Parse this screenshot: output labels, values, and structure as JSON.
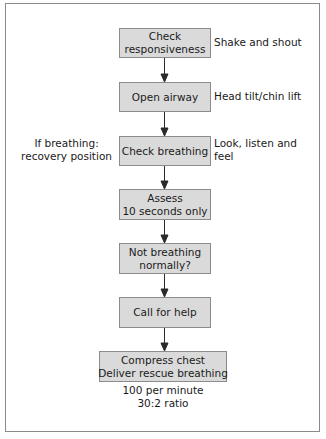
{
  "diagram": {
    "type": "flowchart",
    "title": "",
    "colors": {
      "box_fill": "#dadada",
      "box_border": "#8c8c8c",
      "arrow": "#2a2a2a",
      "frame": "#8a8a8a"
    },
    "steps": [
      {
        "id": "check-responsiveness",
        "lines": [
          "Check",
          "responsiveness"
        ],
        "note_right": [
          "Shake and shout"
        ]
      },
      {
        "id": "open-airway",
        "lines": [
          "Open airway"
        ],
        "note_right": [
          "Head tilt/chin lift"
        ]
      },
      {
        "id": "check-breathing",
        "lines": [
          "Check breathing"
        ],
        "note_right": [
          "Look, listen and",
          "feel"
        ],
        "note_left": [
          "If breathing:",
          "recovery position"
        ]
      },
      {
        "id": "assess",
        "lines": [
          "Assess",
          "10 seconds only"
        ]
      },
      {
        "id": "not-breathing",
        "lines": [
          "Not breathing",
          "normally?"
        ]
      },
      {
        "id": "call-for-help",
        "lines": [
          "Call for help"
        ]
      },
      {
        "id": "compress-chest",
        "lines": [
          "Compress chest",
          "Deliver rescue breathing"
        ],
        "note_below": [
          "100 per minute",
          "30:2 ratio"
        ]
      }
    ],
    "edges": [
      {
        "from": "check-responsiveness",
        "to": "open-airway"
      },
      {
        "from": "open-airway",
        "to": "check-breathing"
      },
      {
        "from": "check-breathing",
        "to": "assess"
      },
      {
        "from": "assess",
        "to": "not-breathing"
      },
      {
        "from": "not-breathing",
        "to": "call-for-help"
      },
      {
        "from": "call-for-help",
        "to": "compress-chest"
      }
    ]
  }
}
